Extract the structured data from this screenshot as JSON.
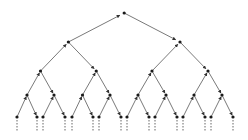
{
  "diagram": {
    "type": "binary-tree",
    "levels": 5,
    "continues_below": true,
    "colors": {
      "edge": "#6a6a6a",
      "node": "#1a1a1a",
      "dash": "#555555",
      "background": "#ffffff"
    },
    "level_y": [
      13,
      42,
      71,
      95,
      117
    ],
    "leaf_x": [
      17,
      37,
      43,
      65,
      72,
      93,
      99,
      121,
      127,
      149,
      155,
      177,
      183,
      205,
      211,
      233
    ],
    "dash_end_y": 131
  }
}
